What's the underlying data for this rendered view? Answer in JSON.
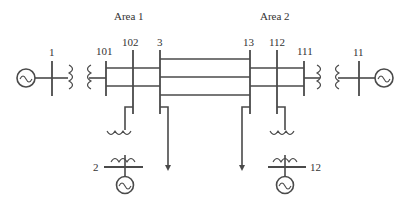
{
  "diagram": {
    "type": "two-area power system one-line diagram",
    "areas": [
      {
        "label": "Area 1"
      },
      {
        "label": "Area 2"
      }
    ],
    "buses": [
      {
        "id": "1",
        "label": "1"
      },
      {
        "id": "101",
        "label": "101"
      },
      {
        "id": "102",
        "label": "102"
      },
      {
        "id": "3",
        "label": "3"
      },
      {
        "id": "13",
        "label": "13"
      },
      {
        "id": "112",
        "label": "112"
      },
      {
        "id": "111",
        "label": "111"
      },
      {
        "id": "11",
        "label": "11"
      },
      {
        "id": "2",
        "label": "2"
      },
      {
        "id": "12",
        "label": "12"
      }
    ],
    "generators": [
      {
        "bus": "1",
        "icon": "ac-generator-icon"
      },
      {
        "bus": "2",
        "icon": "ac-generator-icon"
      },
      {
        "bus": "11",
        "icon": "ac-generator-icon"
      },
      {
        "bus": "12",
        "icon": "ac-generator-icon"
      }
    ],
    "transformers": [
      {
        "from": "1",
        "to": "101"
      },
      {
        "from": "102",
        "to": "2"
      },
      {
        "from": "111",
        "to": "11"
      },
      {
        "from": "112",
        "to": "12"
      }
    ],
    "tie_lines": [
      {
        "from": "3",
        "to": "13",
        "count": 3
      }
    ],
    "loads": [
      {
        "bus": "3",
        "icon": "load-arrow-icon"
      },
      {
        "bus": "13",
        "icon": "load-arrow-icon"
      }
    ],
    "colors": {
      "line": "#4a4a4a",
      "text": "#333333",
      "background": "#ffffff"
    }
  }
}
